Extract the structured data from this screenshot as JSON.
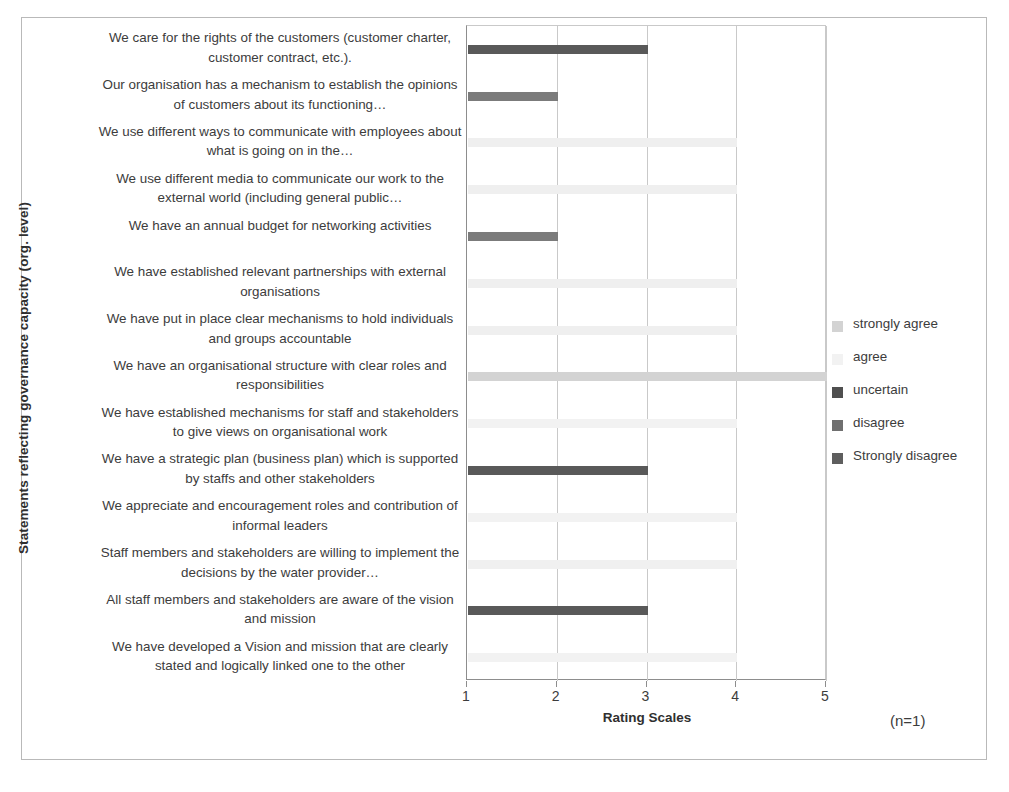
{
  "figure": {
    "ylabel": "Statements reflecting governance capacity (org. level)",
    "xlabel": "Rating Scales",
    "sample_note": "(n=1)"
  },
  "legend": {
    "items": [
      {
        "label": "strongly agree",
        "color": "#d3d3d3"
      },
      {
        "label": "agree",
        "color": "#f2f2f2"
      },
      {
        "label": "uncertain",
        "color": "#4f4f4f"
      },
      {
        "label": "disagree",
        "color": "#6f6f6f"
      },
      {
        "label": "Strongly disagree",
        "color": "#5e5e5e"
      }
    ]
  },
  "chart_data": {
    "type": "bar",
    "orientation": "horizontal",
    "title": "",
    "xlabel": "Rating Scales",
    "ylabel": "Statements reflecting governance capacity (org. level)",
    "xlim": [
      1,
      5
    ],
    "xticks": [
      1,
      2,
      3,
      4,
      5
    ],
    "grid": true,
    "legend_position": "right",
    "annotation": "(n=1)",
    "categories": [
      "We care for the rights of the customers (customer charter, customer contract, etc.).",
      "Our organisation has a mechanism to establish the opinions of customers about its functioning…",
      "We use different ways to communicate with employees about what is going on in the…",
      "We use different media to communicate our work to the external world (including general public…",
      "We have an annual budget for networking activities",
      "We have established relevant partnerships with external organisations",
      "We have put in place clear mechanisms to hold individuals and groups accountable",
      "We have an organisational structure with clear roles and responsibilities",
      "We have established mechanisms for staff and stakeholders to give views on organisational  work",
      "We have a strategic plan (business plan) which is supported by staffs and other stakeholders",
      "We appreciate and  encouragement  roles and contribution of informal leaders",
      "Staff members and stakeholders are willing to implement the decisions by the water provider…",
      "All staff members and stakeholders are aware of the  vision and mission",
      "We have developed a Vision and mission that are clearly stated and logically linked one to the other"
    ],
    "values": [
      3,
      2,
      4,
      4,
      2,
      4,
      4,
      5,
      4,
      3,
      4,
      4,
      3,
      4
    ],
    "ratings": [
      "uncertain",
      "disagree",
      "agree",
      "agree",
      "disagree",
      "agree",
      "agree",
      "strongly agree",
      "agree",
      "uncertain",
      "agree",
      "agree",
      "uncertain",
      "agree"
    ],
    "bar_colors": [
      "#595959",
      "#7b7b7b",
      "#efefef",
      "#efefef",
      "#7b7b7b",
      "#efefef",
      "#efefef",
      "#d3d3d3",
      "#f2f2f2",
      "#595959",
      "#f2f2f2",
      "#f0f0f0",
      "#595959",
      "#f2f2f2"
    ]
  }
}
